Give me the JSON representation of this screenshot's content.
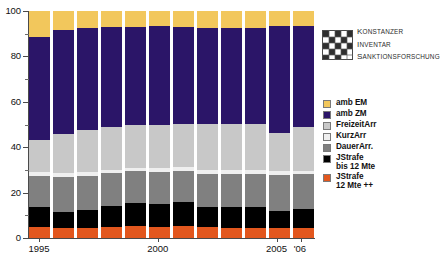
{
  "logo": {
    "name": "konstanzer-inventar-sanktionsforschung-logo",
    "line1_cap": "K",
    "line1_rest": "ONSTANZER",
    "line2_cap": "I",
    "line2_rest": "NVENTAR",
    "line3_cap": "S",
    "line3_rest": "ANKTIONSFORSCHUNG"
  },
  "legend": {
    "position": "right",
    "items": [
      {
        "label": "amb EM",
        "color": "#f2c75c"
      },
      {
        "label": "amb ZM",
        "color": "#2b1568"
      },
      {
        "label": "FreizeitArr",
        "color": "#c8c8c8"
      },
      {
        "label": "KurzArr",
        "color": "#efefef"
      },
      {
        "label": "DauerArr.",
        "color": "#808080"
      },
      {
        "label": "JStrafe\nbis 12 Mte",
        "color": "#000000"
      },
      {
        "label": "JStrafe\n12 Mte ++",
        "color": "#e2571e"
      }
    ]
  },
  "chart_data": {
    "type": "bar",
    "stacked": true,
    "normalized_percent": true,
    "title": "",
    "xlabel": "",
    "ylabel": "",
    "ylim": [
      0,
      100
    ],
    "yticks": [
      0,
      20,
      40,
      60,
      80,
      100
    ],
    "ytick_labels": [
      "0",
      "20",
      "40",
      "60",
      "80",
      "100"
    ],
    "grid": false,
    "categories": [
      "1995",
      "1996",
      "1997",
      "1998",
      "1999",
      "2000",
      "2001",
      "2002",
      "2003",
      "2004",
      "2005",
      "2006"
    ],
    "xtick_labels": [
      {
        "category": "1995",
        "label": "1995"
      },
      {
        "category": "2000",
        "label": "2000"
      },
      {
        "category": "2005",
        "label": "2005"
      },
      {
        "category": "2006",
        "label": "'06"
      }
    ],
    "series": [
      {
        "name": "JStrafe 12 Mte ++",
        "color": "#e2571e",
        "values": [
          5.0,
          4.2,
          4.4,
          4.7,
          5.1,
          5.0,
          5.2,
          4.7,
          4.6,
          4.5,
          4.3,
          4.5
        ]
      },
      {
        "name": "JStrafe bis 12 Mte",
        "color": "#000000",
        "values": [
          8.5,
          7.2,
          8.0,
          9.4,
          10.4,
          9.9,
          10.6,
          9.1,
          9.1,
          9.2,
          7.8,
          8.4
        ]
      },
      {
        "name": "DauerArr.",
        "color": "#808080",
        "values": [
          14.0,
          15.4,
          15.0,
          14.4,
          13.9,
          14.4,
          13.8,
          14.5,
          14.6,
          14.6,
          15.6,
          15.1
        ]
      },
      {
        "name": "KurzArr",
        "color": "#efefef",
        "values": [
          1.8,
          1.9,
          1.7,
          1.6,
          1.5,
          1.5,
          1.5,
          1.6,
          1.6,
          1.6,
          1.8,
          1.7
        ]
      },
      {
        "name": "FreizeitArr",
        "color": "#c8c8c8",
        "values": [
          13.8,
          17.2,
          18.5,
          18.7,
          18.9,
          19.1,
          19.1,
          20.2,
          20.3,
          20.4,
          16.8,
          19.4
        ]
      },
      {
        "name": "amb ZM",
        "color": "#2b1568",
        "values": [
          45.4,
          45.8,
          44.9,
          44.1,
          43.3,
          43.3,
          42.9,
          42.6,
          42.5,
          42.4,
          47.2,
          44.4
        ]
      },
      {
        "name": "amb EM",
        "color": "#f2c75c",
        "values": [
          11.5,
          8.3,
          7.5,
          7.1,
          6.9,
          6.8,
          6.9,
          7.3,
          7.3,
          7.3,
          6.5,
          6.5
        ]
      }
    ]
  }
}
